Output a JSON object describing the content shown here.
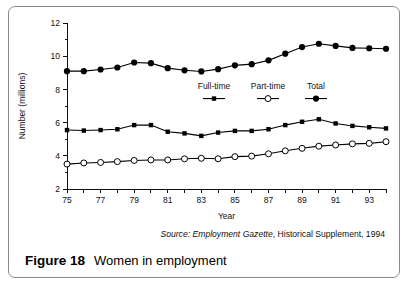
{
  "figure": {
    "caption_label": "Figure 18",
    "caption_text": "Women in employment",
    "source_prefix": "Source:",
    "source_publication": "Employment Gazette",
    "source_rest": ", Historical Supplement, 1994"
  },
  "chart_data": {
    "type": "line",
    "title": "",
    "xlabel": "Year",
    "ylabel": "Number (millions)",
    "xlim": [
      75,
      94
    ],
    "ylim": [
      2,
      12
    ],
    "ytick_step": 2,
    "yticks": [
      2,
      4,
      6,
      8,
      10,
      12
    ],
    "yticks_minor": [
      3,
      5,
      7,
      9,
      11
    ],
    "grid": false,
    "legend_position": "inside-upper-center",
    "x": [
      75,
      76,
      77,
      78,
      79,
      80,
      81,
      82,
      83,
      84,
      85,
      86,
      87,
      88,
      89,
      90,
      91,
      92,
      93,
      94
    ],
    "xtick_labels": [
      "75",
      "",
      "77",
      "",
      "79",
      "",
      "81",
      "",
      "83",
      "",
      "85",
      "",
      "87",
      "",
      "89",
      "",
      "91",
      "",
      "93",
      ""
    ],
    "series": [
      {
        "name": "Full-time",
        "marker": "filled-square",
        "values": [
          5.55,
          5.52,
          5.55,
          5.6,
          5.85,
          5.85,
          5.45,
          5.35,
          5.2,
          5.4,
          5.5,
          5.5,
          5.6,
          5.85,
          6.05,
          6.2,
          5.95,
          5.8,
          5.72,
          5.65
        ]
      },
      {
        "name": "Part-time",
        "marker": "open-circle",
        "values": [
          3.5,
          3.57,
          3.6,
          3.65,
          3.72,
          3.75,
          3.75,
          3.82,
          3.85,
          3.82,
          3.95,
          3.98,
          4.12,
          4.3,
          4.45,
          4.58,
          4.65,
          4.72,
          4.75,
          4.85
        ]
      },
      {
        "name": "Total",
        "marker": "filled-circle",
        "values": [
          9.1,
          9.1,
          9.2,
          9.32,
          9.62,
          9.58,
          9.28,
          9.15,
          9.08,
          9.22,
          9.45,
          9.52,
          9.75,
          10.15,
          10.55,
          10.75,
          10.62,
          10.5,
          10.48,
          10.45
        ]
      }
    ]
  }
}
